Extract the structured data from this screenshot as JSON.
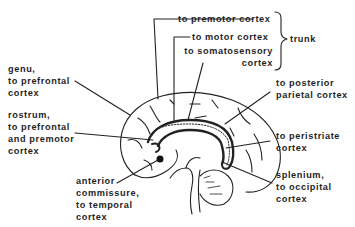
{
  "diagram": {
    "title": "",
    "labels": {
      "premotor": [
        "to premotor cortex"
      ],
      "motor": [
        "to motor cortex"
      ],
      "somatosensory": [
        "to somatosensory",
        "cortex"
      ],
      "trunk": [
        "trunk"
      ],
      "genu": [
        "genu,",
        "to prefrontal",
        "cortex"
      ],
      "rostrum": [
        "rostrum,",
        "to prefrontal",
        "and premotor",
        "cortex"
      ],
      "anterior_commissure": [
        "anterior",
        "commissure,",
        "to temporal",
        "cortex"
      ],
      "posterior_parietal": [
        "to posterior",
        "parietal cortex"
      ],
      "peristriate": [
        "to peristriate",
        "cortex"
      ],
      "splenium": [
        "splenium,",
        "to occipital",
        "cortex"
      ]
    },
    "colors": {
      "ink": "#1f1f1f",
      "background": "#ffffff"
    }
  }
}
